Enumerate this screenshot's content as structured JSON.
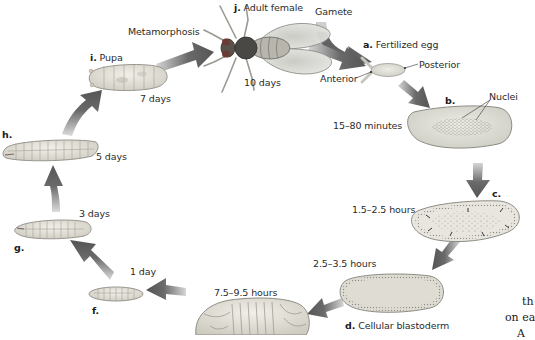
{
  "diagram": {
    "type": "life-cycle",
    "stages": [
      {
        "letter": "a.",
        "name": "Fertilized egg",
        "time": ""
      },
      {
        "letter": "b.",
        "name": "",
        "time": "15–80 minutes"
      },
      {
        "letter": "c.",
        "name": "",
        "time": "1.5–2.5 hours"
      },
      {
        "letter": "d.",
        "name": "Cellular blastoderm",
        "time": "2.5–3.5 hours"
      },
      {
        "letter": "e.",
        "name": "",
        "time": "7.5–9.5 hours"
      },
      {
        "letter": "f.",
        "name": "",
        "time": "1 day"
      },
      {
        "letter": "g.",
        "name": "",
        "time": "3 days"
      },
      {
        "letter": "h.",
        "name": "",
        "time": "5 days"
      },
      {
        "letter": "i.",
        "name": "Pupa",
        "time": "7 days"
      },
      {
        "letter": "j.",
        "name": "Adult female",
        "time": "10 days"
      }
    ],
    "annotations": {
      "gamete": "Gamete",
      "metamorphosis": "Metamorphosis",
      "anterior": "Anterior",
      "posterior": "Posterior",
      "nuclei": "Nuclei"
    },
    "cropped_text": {
      "line1": "th",
      "line2": "on ea",
      "line3": "A"
    },
    "colors": {
      "arrow_dark": "#5b5b5b",
      "arrow_light": "#b3b3b3",
      "egg_fill": "#dcdcd4",
      "egg_outline": "#8a8a84",
      "larva_fill": "#e6e4dc",
      "fly_body": "#3a3a36"
    }
  }
}
